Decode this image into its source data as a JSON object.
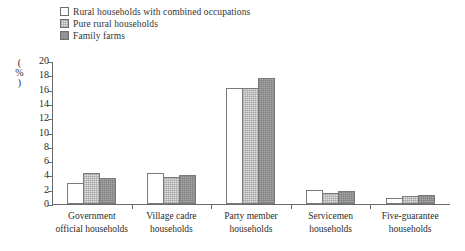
{
  "chart_data": {
    "type": "bar",
    "title": "",
    "xlabel": "",
    "ylabel": "(%)",
    "ylim": [
      0,
      20
    ],
    "ytick_step": 2,
    "yticks": [
      "20",
      "18",
      "16",
      "14",
      "12",
      "10",
      "8",
      "6",
      "4",
      "2",
      "0"
    ],
    "grid": false,
    "legend_position": "top-left",
    "categories": [
      "Government\nofficial households",
      "Village cadre\nhouseholds",
      "Party member\nhouseholds",
      "Servicemen\nhouseholds",
      "Five-guarantee\nhouseholds"
    ],
    "series": [
      {
        "name": "Rural households with combined occupations",
        "fill": "white",
        "values": [
          2.9,
          4.35,
          16.2,
          2.0,
          0.9
        ]
      },
      {
        "name": "Pure rural households",
        "fill": "light-hatch",
        "values": [
          4.35,
          3.75,
          16.2,
          1.6,
          1.1
        ]
      },
      {
        "name": "Family farms",
        "fill": "dark-hatch",
        "values": [
          3.6,
          4.1,
          17.6,
          1.85,
          1.3
        ]
      }
    ]
  },
  "colors": {
    "axis": "#6b6b6b",
    "bar_border": "#7a7a7a",
    "series_0": "#ffffff",
    "series_1": "#e3e3e3",
    "series_2": "#a8a8a8",
    "text": "#2b2b2b",
    "background": "#ffffff"
  }
}
